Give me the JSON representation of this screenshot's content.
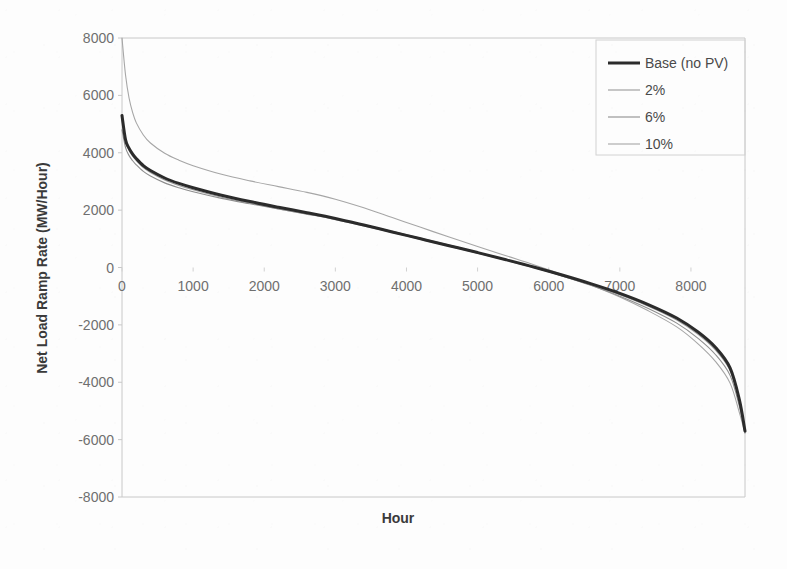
{
  "chart_data": {
    "type": "line",
    "title": "",
    "xlabel": "Hour",
    "ylabel": "Net Load Ramp Rate (MW/Hour)",
    "xlim": [
      0,
      8760
    ],
    "ylim": [
      -8000,
      8000
    ],
    "xticks": [
      0,
      1000,
      2000,
      3000,
      4000,
      5000,
      6000,
      7000,
      8000
    ],
    "yticks": [
      8000,
      6000,
      4000,
      2000,
      0,
      -2000,
      -4000,
      -6000,
      -8000
    ],
    "xtick_labels": [
      "0",
      "1000",
      "2000",
      "3000",
      "4000",
      "5000",
      "6000",
      "7000",
      "8000"
    ],
    "ytick_labels": [
      "8000",
      "6000",
      "4000",
      "2000",
      "0",
      "-2000",
      "-4000",
      "-6000",
      "-8000"
    ],
    "grid": false,
    "legend_position": "top-right",
    "legend_entries": [
      "Base (no PV)",
      "2%",
      "6%",
      "10%"
    ],
    "x": [
      0,
      50,
      100,
      150,
      200,
      300,
      400,
      600,
      800,
      1000,
      1400,
      1800,
      2200,
      2600,
      3000,
      3400,
      3800,
      4200,
      4600,
      5000,
      5400,
      5800,
      6200,
      6600,
      7000,
      7400,
      7800,
      8100,
      8350,
      8550,
      8680,
      8760
    ],
    "series": [
      {
        "name": "Base (no PV)",
        "color": "#2b2b2b",
        "width": 3.0,
        "values": [
          5300,
          4450,
          4150,
          3950,
          3800,
          3550,
          3380,
          3120,
          2930,
          2780,
          2520,
          2300,
          2100,
          1910,
          1710,
          1480,
          1240,
          1000,
          760,
          520,
          270,
          10,
          -270,
          -570,
          -900,
          -1290,
          -1760,
          -2250,
          -2800,
          -3500,
          -4600,
          -5700
        ]
      },
      {
        "name": "2%",
        "color": "#9a9a9a",
        "width": 1.1,
        "values": [
          5150,
          4380,
          4080,
          3880,
          3730,
          3480,
          3310,
          3050,
          2860,
          2710,
          2450,
          2240,
          2040,
          1860,
          1670,
          1450,
          1220,
          980,
          740,
          500,
          250,
          -10,
          -300,
          -610,
          -950,
          -1350,
          -1830,
          -2330,
          -2890,
          -3590,
          -4680,
          -5720
        ]
      },
      {
        "name": "6%",
        "color": "#8e8e8e",
        "width": 1.1,
        "values": [
          4800,
          4180,
          3900,
          3720,
          3580,
          3350,
          3190,
          2950,
          2780,
          2640,
          2410,
          2220,
          2040,
          1870,
          1700,
          1490,
          1260,
          1020,
          780,
          530,
          270,
          0,
          -300,
          -630,
          -1000,
          -1430,
          -1940,
          -2470,
          -3050,
          -3760,
          -4830,
          -5760
        ]
      },
      {
        "name": "10%",
        "color": "#a6a6a6",
        "width": 1.1,
        "values": [
          8000,
          6700,
          5900,
          5400,
          5050,
          4620,
          4340,
          3980,
          3740,
          3550,
          3250,
          3020,
          2820,
          2620,
          2380,
          2080,
          1740,
          1400,
          1060,
          730,
          410,
          90,
          -250,
          -620,
          -1030,
          -1510,
          -2070,
          -2660,
          -3290,
          -4030,
          -5050,
          -5780
        ]
      }
    ]
  }
}
